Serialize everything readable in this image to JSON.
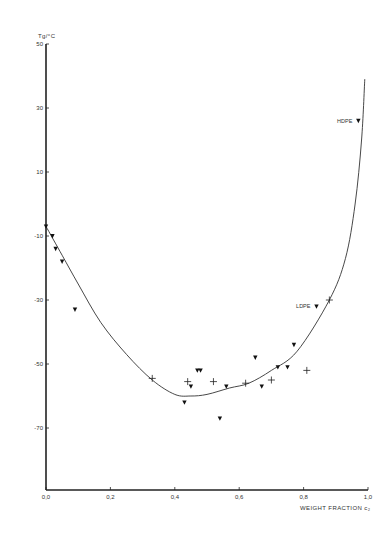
{
  "chart_data": {
    "type": "scatter",
    "title": "",
    "xlabel": "WEIGHT FRACTION c₂",
    "ylabel": "Tg/°C",
    "xlim": [
      0.0,
      1.0
    ],
    "ylim": [
      -70,
      50
    ],
    "grid": false,
    "x_ticks": [
      "0,0",
      "0,2",
      "0,4",
      "0,6",
      "0,8",
      "1,0"
    ],
    "x_tick_values": [
      0.0,
      0.2,
      0.4,
      0.6,
      0.8,
      1.0
    ],
    "y_ticks": [
      "50",
      "30",
      "10",
      "-10",
      "-30",
      "-50",
      "-70"
    ],
    "y_tick_values": [
      50,
      30,
      10,
      -10,
      -30,
      -50,
      -70
    ],
    "series": [
      {
        "name": "triangles",
        "marker": "triangle-down",
        "points": [
          {
            "x": 0.0,
            "y": -7
          },
          {
            "x": 0.02,
            "y": -10
          },
          {
            "x": 0.03,
            "y": -14
          },
          {
            "x": 0.05,
            "y": -18
          },
          {
            "x": 0.09,
            "y": -33
          },
          {
            "x": 0.43,
            "y": -62
          },
          {
            "x": 0.45,
            "y": -57
          },
          {
            "x": 0.47,
            "y": -52
          },
          {
            "x": 0.48,
            "y": -52
          },
          {
            "x": 0.54,
            "y": -67
          },
          {
            "x": 0.56,
            "y": -57
          },
          {
            "x": 0.65,
            "y": -48
          },
          {
            "x": 0.67,
            "y": -57
          },
          {
            "x": 0.72,
            "y": -51
          },
          {
            "x": 0.75,
            "y": -51
          },
          {
            "x": 0.77,
            "y": -44
          },
          {
            "x": 0.84,
            "y": -32
          },
          {
            "x": 0.97,
            "y": 26
          }
        ]
      },
      {
        "name": "crosses",
        "marker": "plus",
        "points": [
          {
            "x": 0.33,
            "y": -54.5
          },
          {
            "x": 0.44,
            "y": -55.5
          },
          {
            "x": 0.52,
            "y": -55.5
          },
          {
            "x": 0.62,
            "y": -56
          },
          {
            "x": 0.7,
            "y": -55
          },
          {
            "x": 0.81,
            "y": -52
          },
          {
            "x": 0.88,
            "y": -30
          }
        ]
      },
      {
        "name": "fit curve",
        "type": "line",
        "points": [
          {
            "x": 0.0,
            "y": -7
          },
          {
            "x": 0.05,
            "y": -16
          },
          {
            "x": 0.1,
            "y": -25
          },
          {
            "x": 0.17,
            "y": -37
          },
          {
            "x": 0.25,
            "y": -47
          },
          {
            "x": 0.33,
            "y": -55
          },
          {
            "x": 0.4,
            "y": -59.5
          },
          {
            "x": 0.45,
            "y": -60
          },
          {
            "x": 0.5,
            "y": -59.5
          },
          {
            "x": 0.57,
            "y": -57.5
          },
          {
            "x": 0.63,
            "y": -56
          },
          {
            "x": 0.7,
            "y": -52
          },
          {
            "x": 0.78,
            "y": -46
          },
          {
            "x": 0.88,
            "y": -30
          },
          {
            "x": 0.93,
            "y": -17
          },
          {
            "x": 0.96,
            "y": 0
          },
          {
            "x": 0.98,
            "y": 20
          },
          {
            "x": 0.99,
            "y": 39
          }
        ]
      }
    ],
    "annotations": [
      {
        "text": "HDPE",
        "x": 0.97,
        "y": 26
      },
      {
        "text": "LDPE",
        "x": 0.84,
        "y": -32
      }
    ]
  }
}
